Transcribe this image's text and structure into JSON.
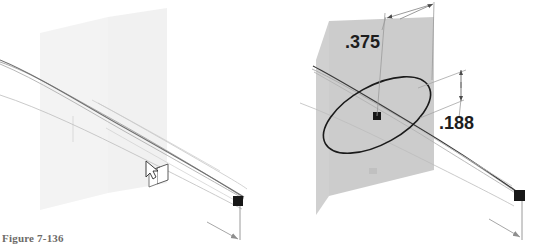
{
  "figure": {
    "caption": "Figure 7-136",
    "caption_color": "#6d6a68",
    "background_color": "#ffffff"
  },
  "panels": [
    {
      "id": "left-panel",
      "name": "sweep-path-view",
      "plane": {
        "name": "reference-plane",
        "fill": "#ededed",
        "opacity": 0.75
      },
      "cursor": {
        "name": "cursor-with-cube",
        "label": "select sweep profile cursor"
      },
      "endpoint": {
        "name": "endpoint-marker",
        "color": "#171717"
      },
      "curves": {
        "color": "#9a9a9a",
        "highlight_color": "#6f6f6f"
      }
    },
    {
      "id": "right-panel",
      "name": "sweep-profile-dimensioned-view",
      "plane": {
        "name": "reference-plane",
        "fill": "#c9c9c9",
        "opacity": 0.92
      },
      "ellipse": {
        "name": "ellipse-profile",
        "stroke": "#1a1a1a"
      },
      "center_point": {
        "name": "ellipse-center-point",
        "color": "#171717"
      },
      "endpoint": {
        "name": "endpoint-marker",
        "color": "#171717"
      },
      "curves": {
        "color": "#9a9a9a",
        "highlight_color": "#3a3a3a"
      }
    }
  ],
  "dimensions": [
    {
      "name": "major-axis-dimension",
      "value": ".375",
      "orientation": "horizontal-isometric",
      "x": 345,
      "y": 48
    },
    {
      "name": "minor-axis-dimension",
      "value": ".188",
      "orientation": "vertical-isometric",
      "x": 439,
      "y": 129
    }
  ]
}
